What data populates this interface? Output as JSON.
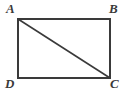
{
  "figure": {
    "type": "geometry-diagram",
    "shape": "rectangle-with-diagonal",
    "background_color": "#ffffff",
    "stroke_color": "#3a3a3a",
    "stroke_width": 1.6,
    "rectangle": {
      "left": 18,
      "top": 19,
      "right": 110,
      "bottom": 78,
      "width": 92,
      "height": 59
    },
    "diagonal": {
      "from": "A",
      "to": "C",
      "x1": 18,
      "y1": 19,
      "x2": 110,
      "y2": 78
    },
    "vertices": [
      {
        "id": "A",
        "label": "A",
        "position": "top-left",
        "x": 18,
        "y": 19
      },
      {
        "id": "B",
        "label": "B",
        "position": "top-right",
        "x": 110,
        "y": 19
      },
      {
        "id": "C",
        "label": "C",
        "position": "bottom-right",
        "x": 110,
        "y": 78
      },
      {
        "id": "D",
        "label": "D",
        "position": "bottom-left",
        "x": 18,
        "y": 78
      }
    ]
  }
}
